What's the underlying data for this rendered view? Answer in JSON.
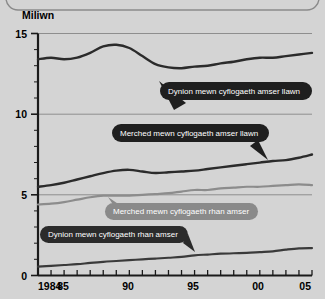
{
  "panel": {
    "background_color": "#d4d4d4",
    "border_color": "#8a8a8a"
  },
  "chart_data": {
    "type": "line",
    "title": "",
    "subtitle": "",
    "xlabel": "",
    "ylabel": "Miliwn",
    "ylim": [
      0,
      15
    ],
    "xlim": [
      1984,
      2005
    ],
    "grid": true,
    "legend_position": "inline-callouts",
    "ytick_labels": [
      "0",
      "5",
      "10",
      "15"
    ],
    "ytick_values": [
      0,
      5,
      10,
      15
    ],
    "xtick_labels": [
      "1984",
      "85",
      "90",
      "95",
      "00",
      "05"
    ],
    "xtick_values": [
      1984,
      1985,
      1990,
      1995,
      2000,
      2005
    ],
    "x": [
      1984,
      1985,
      1986,
      1987,
      1988,
      1989,
      1990,
      1991,
      1992,
      1993,
      1994,
      1995,
      1996,
      1997,
      1998,
      1999,
      2000,
      2001,
      2002,
      2003,
      2004,
      2005
    ],
    "series": [
      {
        "name": "Dynion mewn cyflogaeth amser llawn",
        "color": "#2b2b2b",
        "width": 2.4,
        "values": [
          13.4,
          13.5,
          13.4,
          13.5,
          13.8,
          14.2,
          14.3,
          14.1,
          13.6,
          13.1,
          12.9,
          12.85,
          12.95,
          13.0,
          13.15,
          13.25,
          13.4,
          13.5,
          13.5,
          13.6,
          13.7,
          13.8
        ]
      },
      {
        "name": "Merched mewn cyflogaeth amser llawn",
        "color": "#2b2b2b",
        "width": 2.4,
        "values": [
          5.5,
          5.6,
          5.75,
          5.95,
          6.15,
          6.35,
          6.5,
          6.55,
          6.45,
          6.35,
          6.4,
          6.45,
          6.5,
          6.6,
          6.7,
          6.8,
          6.9,
          7.0,
          7.1,
          7.15,
          7.3,
          7.5
        ]
      },
      {
        "name": "Merched mewn cyflogaeth rhan amser",
        "color": "#8c8c8c",
        "width": 2.2,
        "values": [
          4.4,
          4.45,
          4.55,
          4.7,
          4.85,
          4.95,
          4.95,
          4.95,
          5.0,
          5.05,
          5.1,
          5.2,
          5.3,
          5.3,
          5.4,
          5.45,
          5.5,
          5.5,
          5.55,
          5.6,
          5.65,
          5.6
        ]
      },
      {
        "name": "Dynion mewn cyflogaeth rhan amser",
        "color": "#3a3a3a",
        "width": 2.2,
        "values": [
          0.55,
          0.6,
          0.65,
          0.7,
          0.78,
          0.85,
          0.9,
          0.95,
          1.0,
          1.05,
          1.1,
          1.15,
          1.25,
          1.3,
          1.35,
          1.38,
          1.4,
          1.45,
          1.5,
          1.6,
          1.68,
          1.7
        ]
      }
    ],
    "annotations": [
      {
        "id": "callout-men-fulltime",
        "label": "Dynion mewn cyflogaeth amser llawn",
        "fill": "#1f1f1f",
        "text_color": "#ffffff",
        "points_to_year": 1993,
        "points_to_value": 12.9
      },
      {
        "id": "callout-women-fulltime",
        "label": "Merched mewn cyflogaeth amser llawn",
        "fill": "#1f1f1f",
        "text_color": "#ffffff",
        "points_to_year": 2002,
        "points_to_value": 7.1
      },
      {
        "id": "callout-women-parttime",
        "label": "Merched mewn cyflogaeth rhan amser",
        "fill": "#8a8a8a",
        "text_color": "#ffffff",
        "points_to_year": 1989,
        "points_to_value": 4.95
      },
      {
        "id": "callout-men-parttime",
        "label": "Dynion mewn cyflogaeth rhan amser",
        "fill": "#2b2b2b",
        "text_color": "#ffffff",
        "points_to_year": 1996,
        "points_to_value": 1.25
      }
    ]
  }
}
